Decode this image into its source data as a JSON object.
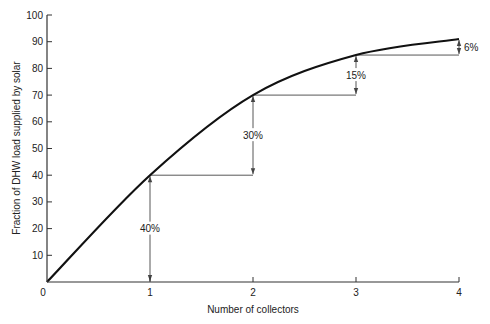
{
  "chart_data": {
    "type": "line",
    "title": "",
    "xlabel": "Number of collectors",
    "ylabel": "Fraction of DHW load supplied by solar",
    "x": [
      0,
      1,
      2,
      3,
      4
    ],
    "values": [
      0,
      40,
      70,
      85,
      91
    ],
    "series": [
      {
        "name": "Solar fraction",
        "x": [
          0,
          1,
          2,
          3,
          4
        ],
        "values": [
          0,
          40,
          70,
          85,
          91
        ]
      }
    ],
    "xlim": [
      0,
      4
    ],
    "ylim": [
      0,
      100
    ],
    "xticks": [
      0,
      1,
      2,
      3,
      4
    ],
    "xtick_labels": [
      "0",
      "1",
      "2",
      "3",
      "4"
    ],
    "yticks": [
      10,
      20,
      30,
      40,
      50,
      60,
      70,
      80,
      90,
      100
    ],
    "ytick_labels": [
      "10",
      "20",
      "30",
      "40",
      "50",
      "60",
      "70",
      "80",
      "90",
      "100"
    ],
    "origin_label": "0",
    "grid": false,
    "legend": "none",
    "annotations": [
      {
        "x": 1,
        "from": 0,
        "to": 40,
        "label": "40%",
        "step_line_to_x": 2
      },
      {
        "x": 2,
        "from": 40,
        "to": 70,
        "label": "30%",
        "step_line_to_x": 3
      },
      {
        "x": 3,
        "from": 70,
        "to": 85,
        "label": "15%",
        "step_line_to_x": 4
      },
      {
        "x": 4,
        "from": 85,
        "to": 91,
        "label": "6%",
        "step_line_to_x": null
      }
    ]
  },
  "colors": {
    "line": "#111111",
    "axis": "#333333",
    "annotation": "#444444",
    "text": "#222222"
  }
}
